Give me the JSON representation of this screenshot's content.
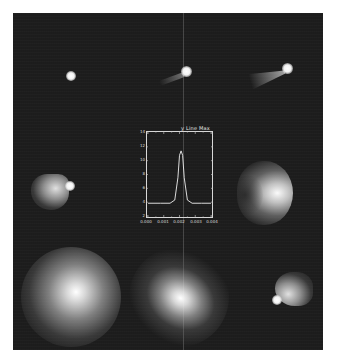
{
  "figure": {
    "background": "#1d1d1d",
    "page_background": "#ffffff",
    "panels": [
      {
        "id": "top-left",
        "description": "small compact comet coma, no tail"
      },
      {
        "id": "top-center",
        "description": "comet coma with short faint tail toward lower-left"
      },
      {
        "id": "top-right",
        "description": "comet coma with fan-shaped tail toward lower-left"
      },
      {
        "id": "middle-left",
        "description": "comet with broad fan tail toward left"
      },
      {
        "id": "middle-right",
        "description": "large crescent-shaped diffuse coma"
      },
      {
        "id": "bottom-left",
        "description": "large diffuse bright coma"
      },
      {
        "id": "bottom-center",
        "description": "large diffuse bright elongated coma"
      },
      {
        "id": "bottom-right",
        "description": "comet with fan tail toward upper-right, nucleus at lower-left"
      }
    ]
  },
  "chart_data": {
    "type": "line",
    "title": "y Line Max",
    "xlabel": "",
    "ylabel": "",
    "x_tick_labels": [
      "0.000",
      "0.001",
      "0.002",
      "0.003",
      "0.004"
    ],
    "y_tick_labels": [
      "2",
      "4",
      "6",
      "8",
      "10",
      "12",
      "14"
    ],
    "grid": false,
    "legend": null,
    "series": [
      {
        "name": "y line max",
        "x": [
          0.0,
          0.0008,
          0.0014,
          0.0017,
          0.0019,
          0.002,
          0.0021,
          0.0022,
          0.0023,
          0.0025,
          0.0028,
          0.0034,
          0.004
        ],
        "y": [
          4,
          4,
          4,
          4.5,
          8,
          11.5,
          12.2,
          11.5,
          8,
          4.5,
          4,
          4,
          4
        ]
      }
    ],
    "xlim": [
      0.0,
      0.004
    ],
    "ylim": [
      2,
      15
    ]
  }
}
